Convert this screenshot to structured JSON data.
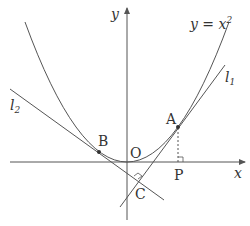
{
  "diagram": {
    "curve_label": {
      "text": "y = x",
      "exponent": "2"
    },
    "axes": {
      "x_label": "x",
      "y_label": "y",
      "origin_label": "O"
    },
    "points": [
      {
        "name": "A",
        "label": "A",
        "description": "point on parabola, tangency point of l1"
      },
      {
        "name": "B",
        "label": "B",
        "description": "point on parabola, tangency point of l2"
      },
      {
        "name": "C",
        "label": "C",
        "description": "intersection of l1 and l2, right angle"
      },
      {
        "name": "P",
        "label": "P",
        "description": "foot of perpendicular from A to x-axis"
      }
    ],
    "lines": [
      {
        "name": "l1",
        "label": "l",
        "subscript": "1",
        "description": "tangent at A"
      },
      {
        "name": "l2",
        "label": "l",
        "subscript": "2",
        "description": "tangent at B"
      }
    ],
    "colors": {
      "stroke": "#555555",
      "text": "#333333",
      "background": "#ffffff"
    }
  }
}
